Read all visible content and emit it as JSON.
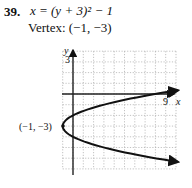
{
  "problem": {
    "number": "39.",
    "equation": "x = (y + 3)² − 1",
    "vertex_text": "Vertex: (−1, −3)"
  },
  "graph": {
    "y_axis_label": "y",
    "x_axis_label": "x",
    "y_tick_label": "3",
    "x_tick_label": "9",
    "vertex_label": "(−1, −3)"
  },
  "chart_data": {
    "type": "line",
    "xlabel": "x",
    "ylabel": "y",
    "xlim": [
      -1,
      10
    ],
    "ylim": [
      -7,
      4
    ],
    "grid": true,
    "labeled_ticks": {
      "x": [
        9
      ],
      "y": [
        3
      ]
    },
    "annotations": [
      {
        "text": "(−1, −3)",
        "x": -1,
        "y": -3
      }
    ],
    "series": [
      {
        "name": "x = (y+3)^2 − 1",
        "x": [
          10,
          8,
          6,
          4,
          2,
          0,
          -0.75,
          -1,
          -0.75,
          0,
          2,
          4,
          6,
          8,
          10
        ],
        "y": [
          0.32,
          0,
          -0.35,
          -0.76,
          -1.27,
          -2,
          -2.5,
          -3,
          -3.5,
          -4,
          -4.73,
          -5.24,
          -5.65,
          -6,
          -6.32
        ]
      }
    ],
    "vertex": [
      -1,
      -3
    ]
  }
}
